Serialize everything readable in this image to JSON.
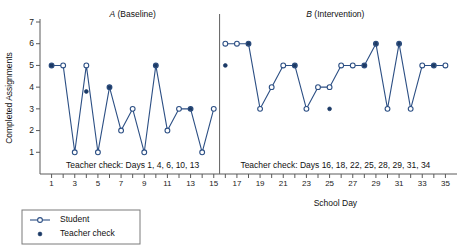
{
  "chart_data": {
    "type": "line",
    "title": "",
    "xlabel": "School Day",
    "ylabel": "Completed Assignments",
    "ylim": [
      0,
      7
    ],
    "xlim": [
      0,
      36
    ],
    "yticks": [
      1,
      2,
      3,
      4,
      5,
      6,
      7
    ],
    "xticks": [
      1,
      2,
      3,
      4,
      5,
      6,
      7,
      8,
      9,
      10,
      11,
      12,
      13,
      14,
      15,
      16,
      17,
      18,
      19,
      20,
      21,
      22,
      23,
      24,
      25,
      26,
      27,
      28,
      29,
      30,
      31,
      32,
      33,
      34,
      35
    ],
    "xticklabels_shown": [
      1,
      3,
      5,
      7,
      9,
      11,
      13,
      15,
      17,
      19,
      21,
      23,
      25,
      27,
      29,
      31,
      33,
      35
    ],
    "grid": false,
    "legend_position": "below-left",
    "phases": [
      {
        "id": "A",
        "label_italic": "A",
        "label_rest": " (Baseline)",
        "x_start": 1,
        "x_end": 15
      },
      {
        "id": "B",
        "label_italic": "B",
        "label_rest": " (Intervention)",
        "x_start": 16,
        "x_end": 35
      }
    ],
    "phase_line_x": 15.5,
    "annotations": [
      {
        "text": "Teacher check: Days 1, 4, 6, 10, 13",
        "phase": "A"
      },
      {
        "text": "Teacher check: Days 16, 18, 22, 25, 28, 29, 31, 34",
        "phase": "B"
      }
    ],
    "series": [
      {
        "name": "Student",
        "marker": "open-circle",
        "color": "#2c4f84",
        "x": [
          1,
          2,
          3,
          4,
          5,
          6,
          7,
          8,
          9,
          10,
          11,
          12,
          13,
          14,
          15
        ],
        "y": [
          5,
          5,
          1,
          5,
          1,
          4,
          2,
          3,
          1,
          5,
          2,
          3,
          3,
          1,
          3
        ]
      },
      {
        "name": "Student",
        "marker": "open-circle",
        "color": "#2c4f84",
        "x": [
          16,
          17,
          18,
          19,
          20,
          21,
          22,
          23,
          24,
          25,
          26,
          27,
          28,
          29,
          30,
          31,
          32,
          33,
          34,
          35
        ],
        "y": [
          6,
          6,
          6,
          3,
          4,
          5,
          5,
          3,
          4,
          4,
          5,
          5,
          5,
          6,
          3,
          6,
          3,
          5,
          5,
          5
        ]
      }
    ],
    "teacher_checks": [
      {
        "x": 1,
        "y": 5
      },
      {
        "x": 4,
        "y": 3.8
      },
      {
        "x": 6,
        "y": 4
      },
      {
        "x": 10,
        "y": 5
      },
      {
        "x": 13,
        "y": 3
      },
      {
        "x": 16,
        "y": 5
      },
      {
        "x": 18,
        "y": 6
      },
      {
        "x": 22,
        "y": 5
      },
      {
        "x": 25,
        "y": 3
      },
      {
        "x": 28,
        "y": 5
      },
      {
        "x": 29,
        "y": 6
      },
      {
        "x": 31,
        "y": 6
      },
      {
        "x": 34,
        "y": 5
      }
    ],
    "legend": [
      {
        "label": "Student",
        "marker": "line-open-circle"
      },
      {
        "label": "Teacher check",
        "marker": "filled-dot"
      }
    ],
    "colors": {
      "line": "#2c4f84",
      "teacher_dot": "#1b3a66",
      "axis": "#5a5a5a",
      "phase_divider": "#6d6d6d"
    }
  }
}
